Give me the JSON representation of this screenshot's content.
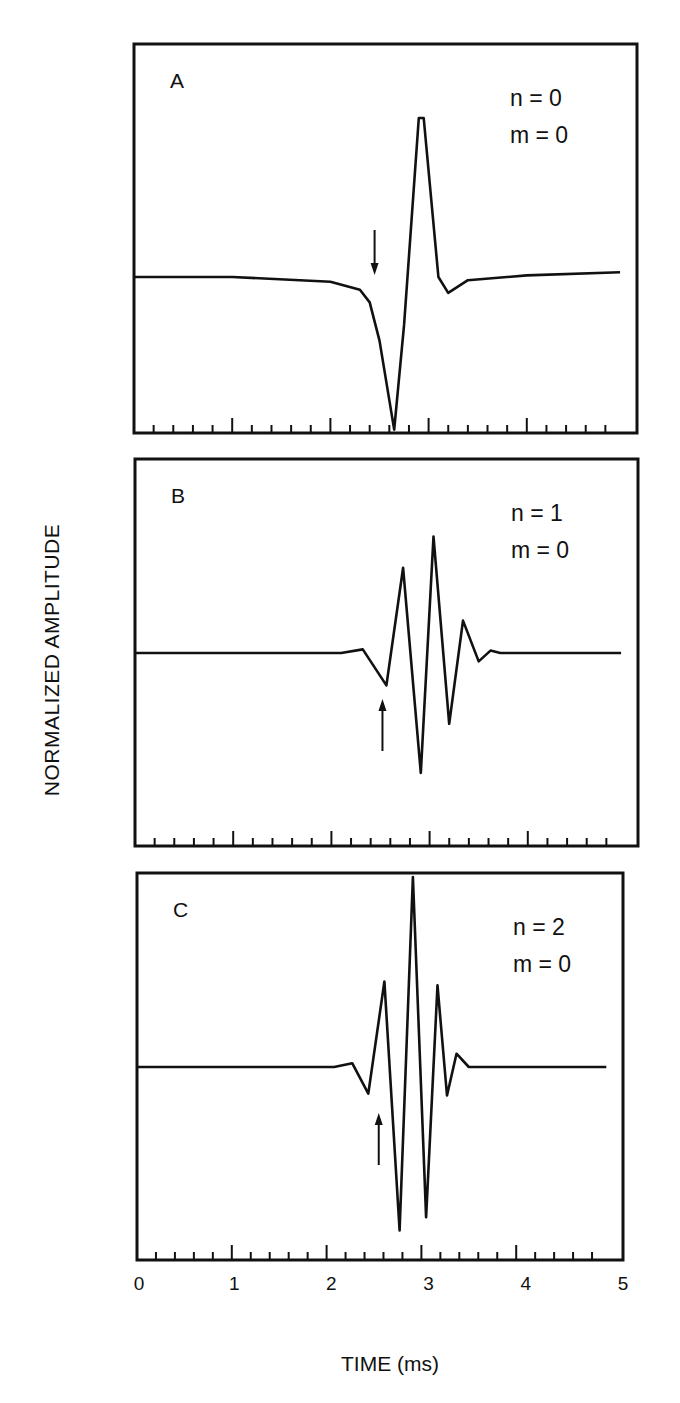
{
  "figure": {
    "ylabel": "NORMALIZED AMPLITUDE",
    "xlabel": "TIME (ms)",
    "x_ticks": [
      "0",
      "1",
      "2",
      "3",
      "4",
      "5"
    ]
  },
  "colors": {
    "ink": "#111111",
    "background": "#ffffff"
  },
  "chart_data": {
    "type": "line",
    "xlabel": "TIME (ms)",
    "ylabel": "NORMALIZED AMPLITUDE",
    "xlim": [
      0,
      5
    ],
    "x_major_ticks": [
      0,
      1,
      2,
      3,
      4,
      5
    ],
    "x_minor_tick_step": 0.2,
    "grid": false,
    "panels": [
      {
        "label": "A",
        "params": [
          "n = 0",
          "m = 0"
        ],
        "arrow": {
          "t": 2.45,
          "direction": "down"
        },
        "box": {
          "x": 134,
          "y": 44,
          "w": 503,
          "h": 389
        },
        "baseline_y": 277,
        "series": {
          "name": "n=0, m=0",
          "t": [
            0.0,
            1.0,
            2.0,
            2.3,
            2.4,
            2.5,
            2.65,
            2.75,
            2.9,
            2.95,
            3.1,
            3.2,
            3.4,
            4.0,
            4.95
          ],
          "amp": [
            0.0,
            0.0,
            -0.03,
            -0.08,
            -0.16,
            -0.4,
            -0.96,
            -0.3,
            1.0,
            1.0,
            0.0,
            -0.1,
            -0.02,
            0.01,
            0.03
          ]
        }
      },
      {
        "label": "B",
        "params": [
          "n = 1",
          "m = 0"
        ],
        "arrow": {
          "t": 2.52,
          "direction": "up"
        },
        "box": {
          "x": 135,
          "y": 459,
          "w": 503,
          "h": 387
        },
        "baseline_y": 653,
        "series": {
          "name": "n=1, m=0",
          "t": [
            0.0,
            2.1,
            2.32,
            2.56,
            2.73,
            2.91,
            3.04,
            3.2,
            3.34,
            3.5,
            3.62,
            3.72,
            4.95
          ],
          "amp": [
            0.0,
            0.0,
            0.03,
            -0.27,
            0.71,
            -1.0,
            0.97,
            -0.59,
            0.27,
            -0.07,
            0.02,
            0.0,
            0.0
          ]
        }
      },
      {
        "label": "C",
        "params": [
          "n = 2",
          "m = 0"
        ],
        "arrow": {
          "t": 2.55,
          "direction": "up"
        },
        "box": {
          "x": 137,
          "y": 873,
          "w": 486,
          "h": 387
        },
        "baseline_y": 1067,
        "series": {
          "name": "n=2, m=0",
          "t": [
            0.0,
            2.08,
            2.27,
            2.44,
            2.61,
            2.77,
            2.91,
            3.05,
            3.17,
            3.27,
            3.37,
            3.5,
            4.95
          ],
          "amp": [
            0.0,
            0.0,
            0.02,
            -0.14,
            0.45,
            -0.86,
            1.0,
            -0.79,
            0.43,
            -0.15,
            0.07,
            0.0,
            0.0
          ]
        }
      }
    ]
  }
}
